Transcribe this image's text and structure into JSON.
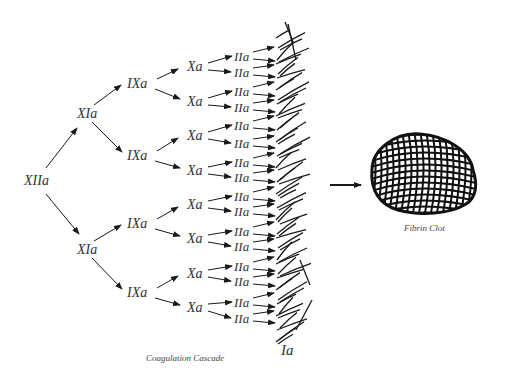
{
  "diagram": {
    "caption": "Coagulation Cascade",
    "product_label": "Ia",
    "result_label": "Fibrin Clot",
    "levels": [
      {
        "name": "XIIa",
        "count": 1
      },
      {
        "name": "XIa",
        "count": 2
      },
      {
        "name": "IXa",
        "count": 4
      },
      {
        "name": "Xa",
        "count": 8
      },
      {
        "name": "IIa",
        "count": 16
      }
    ],
    "nodes": {
      "xiia": [
        "XIIa"
      ],
      "xia": [
        "XIa",
        "XIa"
      ],
      "ixa": [
        "IXa",
        "IXa",
        "IXa",
        "IXa"
      ],
      "xa": [
        "Xa",
        "Xa",
        "Xa",
        "Xa",
        "Xa",
        "Xa",
        "Xa",
        "Xa"
      ],
      "iia": [
        "IIa",
        "IIa",
        "IIa",
        "IIa",
        "IIa",
        "IIa",
        "IIa",
        "IIa",
        "IIa",
        "IIa",
        "IIa",
        "IIa",
        "IIa",
        "IIa",
        "IIa",
        "IIa"
      ]
    },
    "edges_description": "Each factor activates two of the next: XIIa → 2×XIa → 4×IXa → 8×Xa → 16×IIa → 32 arrows into fibrin (Ia) strands → Fibrin Clot",
    "colors": {
      "ink": "#1a1a1a",
      "text": "#333333",
      "background": "#ffffff"
    }
  }
}
